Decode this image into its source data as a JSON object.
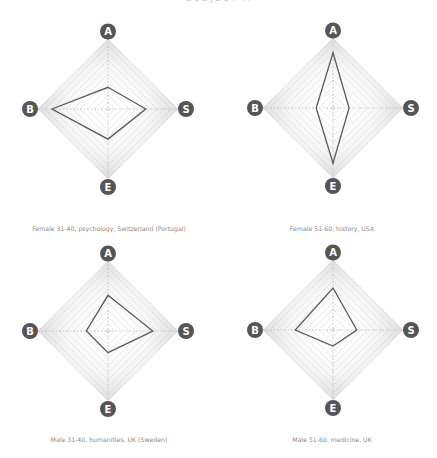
{
  "header": {
    "title_partial": "SUBJECT A"
  },
  "axes_labels": [
    "A",
    "S",
    "E",
    "B"
  ],
  "colors": {
    "badge_fill": "#555555",
    "badge_text": "#ffffff",
    "grid_line": "#bbbbbb",
    "polygon_stroke": "#5a5a5a",
    "caption_text": "#8a8a8a"
  },
  "chart_data": [
    {
      "type": "radar",
      "title": "Female 31-40, psychology, Switzerland (Portugal)",
      "axes": [
        "A",
        "S",
        "E",
        "B"
      ],
      "values": {
        "A": 0.31,
        "S": 0.54,
        "E": 0.43,
        "B": 0.8
      },
      "range": [
        0,
        1
      ],
      "grid_rings": 10
    },
    {
      "type": "radar",
      "title": "Female 51-60, history, USA",
      "axes": [
        "A",
        "S",
        "E",
        "B"
      ],
      "values": {
        "A": 0.79,
        "S": 0.23,
        "E": 0.79,
        "B": 0.24
      },
      "range": [
        0,
        1
      ],
      "grid_rings": 10
    },
    {
      "type": "radar",
      "title": "Male 31-40, humanities, UK (Sweden)",
      "axes": [
        "A",
        "S",
        "E",
        "B"
      ],
      "values": {
        "A": 0.51,
        "S": 0.64,
        "E": 0.31,
        "B": 0.31
      },
      "range": [
        0,
        1
      ],
      "grid_rings": 10
    },
    {
      "type": "radar",
      "title": "Male 51-60, medicine, UK",
      "axes": [
        "A",
        "S",
        "E",
        "B"
      ],
      "values": {
        "A": 0.6,
        "S": 0.34,
        "E": 0.23,
        "B": 0.54
      },
      "range": [
        0,
        1
      ],
      "grid_rings": 10
    }
  ],
  "layout": [
    {
      "cx": 108,
      "cy": 109,
      "r": 70,
      "caption_x": 109,
      "caption_y": 225
    },
    {
      "cx": 333,
      "cy": 108,
      "r": 70,
      "caption_x": 332,
      "caption_y": 225
    },
    {
      "cx": 108,
      "cy": 331,
      "r": 70,
      "caption_x": 109,
      "caption_y": 436
    },
    {
      "cx": 333,
      "cy": 330,
      "r": 70,
      "caption_x": 332,
      "caption_y": 436
    }
  ]
}
